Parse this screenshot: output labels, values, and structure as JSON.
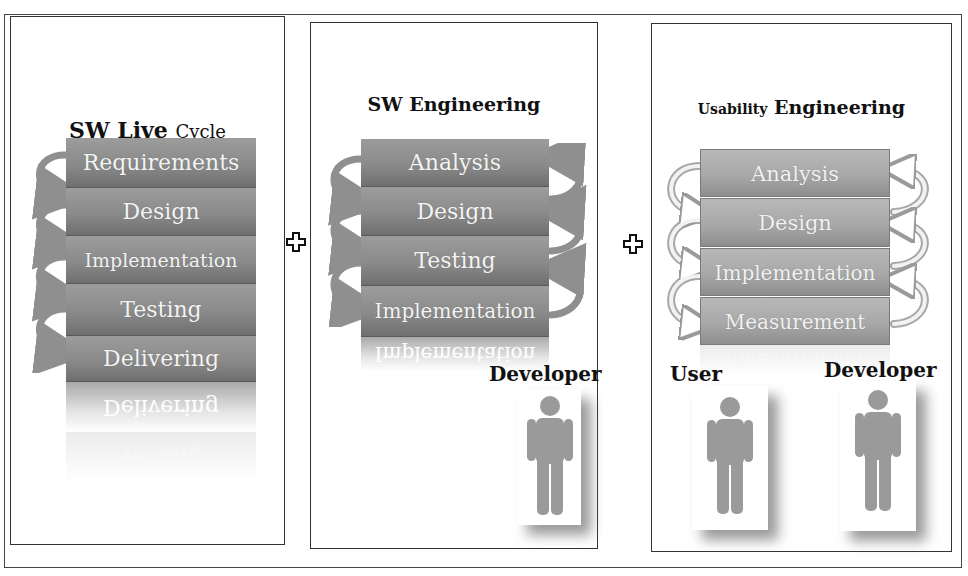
{
  "panels": {
    "sw_life_cycle": {
      "title_bold": "SW Live",
      "title_rest": "Cycle",
      "steps": [
        "Requirements",
        "Design",
        "Implementation",
        "Testing",
        "Delivering"
      ],
      "reflection": [
        "Delivering",
        "Testing"
      ]
    },
    "sw_engineering": {
      "title": "SW Engineering",
      "steps": [
        "Analysis",
        "Design",
        "Testing",
        "Implementation"
      ],
      "reflection": "Implementation",
      "role": "Developer"
    },
    "usability_engineering": {
      "title_small": "Usability",
      "title_rest": "Engineering",
      "steps": [
        "Analysis",
        "Design",
        "Implementation",
        "Measurement"
      ],
      "reflection": "Measurement",
      "roles": [
        "User",
        "Developer"
      ]
    }
  },
  "operators": [
    "plus",
    "plus"
  ],
  "icons": {
    "cycle_arrow": "curved-arrow-icon",
    "plus": "plus-icon",
    "person": "person-icon"
  },
  "colors": {
    "block_dark": "#8a8a8a",
    "block_light": "#a8a8a8",
    "arrow": "#8f8f8f",
    "person": "#9a9a9a",
    "border": "#333333"
  }
}
